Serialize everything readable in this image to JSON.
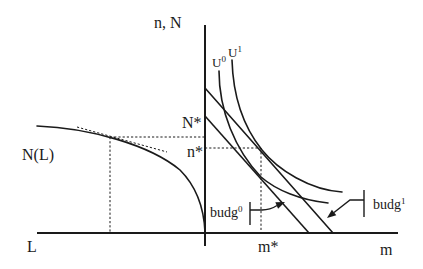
{
  "figure": {
    "vertical_axis_label": "n, N",
    "horizontal_axis_left_label": "L",
    "horizontal_axis_right_label": "m",
    "production_curve_label": "N(L)",
    "indifference_curves": [
      {
        "base": "U",
        "sup": "0"
      },
      {
        "base": "U",
        "sup": "1"
      }
    ],
    "levels": {
      "N_star": "N*",
      "n_star": "n*",
      "m_star": "m*"
    },
    "budget_lines": [
      {
        "base": "budg",
        "sup": "0"
      },
      {
        "base": "budg",
        "sup": "1"
      }
    ]
  },
  "colors": {
    "ink": "#1a1a1a",
    "background": "#ffffff"
  }
}
